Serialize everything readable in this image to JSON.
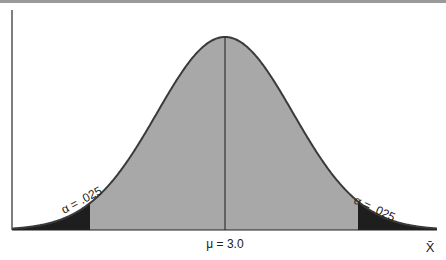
{
  "chart_data": {
    "type": "area",
    "title": "",
    "mean_label": "μ = 3.0",
    "mean": 3.0,
    "xlabel": "X̄",
    "ylabel": "",
    "tails": [
      {
        "side": "left",
        "label": "α = .025",
        "alpha": 0.025
      },
      {
        "side": "right",
        "label": "α = .025",
        "alpha": 0.025
      }
    ],
    "center_region": {
      "area": 0.95
    },
    "grid": false
  },
  "colors": {
    "tail_fill": "#1e1e1e",
    "center_fill": "#a8a8a8",
    "curve_stroke": "#3a3a3a",
    "axis": "#555555"
  }
}
